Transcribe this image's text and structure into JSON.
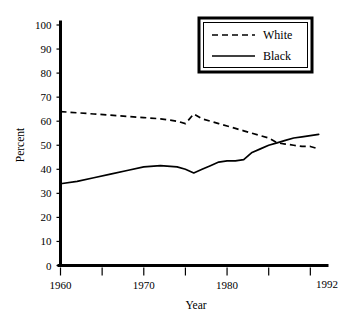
{
  "chart_data": {
    "type": "line",
    "title": "",
    "xlabel": "Year",
    "ylabel": "Percent",
    "xlim": [
      1960,
      1992
    ],
    "ylim": [
      0,
      100
    ],
    "grid": false,
    "legend_position": "top-right",
    "x_ticks": [
      1960,
      1965,
      1970,
      1975,
      1980,
      1985,
      1990
    ],
    "x_tick_labels": [
      "1960",
      "",
      "1970",
      "",
      "1980",
      "",
      ""
    ],
    "x_axis_end_label": "1992",
    "y_ticks": [
      0,
      10,
      20,
      30,
      40,
      50,
      60,
      70,
      80,
      90,
      100
    ],
    "y_tick_labels": [
      "0",
      "10",
      "20",
      "30",
      "40",
      "50",
      "60",
      "70",
      "80",
      "90",
      "100"
    ],
    "series": [
      {
        "name": "White",
        "style": "dashed",
        "color": "#000000",
        "x": [
          1960,
          1962,
          1964,
          1966,
          1968,
          1970,
          1972,
          1974,
          1975,
          1976,
          1977,
          1978,
          1979,
          1980,
          1981,
          1982,
          1983,
          1984,
          1985,
          1986,
          1987,
          1988,
          1989,
          1990,
          1991
        ],
        "values": [
          64,
          63.5,
          63,
          62.5,
          62,
          61.5,
          61,
          60,
          59,
          63,
          61,
          60,
          59,
          58,
          57,
          56,
          55,
          54,
          53,
          51,
          50.5,
          50,
          49.5,
          49.5,
          48.5
        ]
      },
      {
        "name": "Black",
        "style": "solid",
        "color": "#000000",
        "x": [
          1960,
          1962,
          1964,
          1966,
          1968,
          1970,
          1972,
          1974,
          1975,
          1976,
          1977,
          1978,
          1979,
          1980,
          1981,
          1982,
          1983,
          1984,
          1985,
          1986,
          1987,
          1988,
          1989,
          1990,
          1991
        ],
        "values": [
          34,
          35,
          36.5,
          38,
          39.5,
          41,
          41.5,
          41,
          40,
          38.5,
          40,
          41.5,
          43,
          43.5,
          43.5,
          44,
          47,
          48.5,
          50,
          51,
          52,
          53,
          53.5,
          54,
          54.5
        ]
      }
    ],
    "legend_entries": [
      {
        "label": "White",
        "style": "dashed"
      },
      {
        "label": "Black",
        "style": "solid"
      }
    ]
  }
}
